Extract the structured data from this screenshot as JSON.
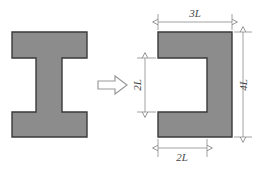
{
  "figure": {
    "background_color": "#ffffff",
    "shape_fill_color": "#8c8c8c",
    "shape_stroke_color": "#3a3a3a",
    "dimension_line_color": "#8a8a8a",
    "label_color": "#4a4a4a"
  },
  "left_shape": {
    "name": "I-beam cross-section",
    "type": "I-section",
    "description": "Symmetric I-shaped (H-shaped) cross-section with two flanges and a central web"
  },
  "transform_arrow": {
    "name": "transformation arrow",
    "direction": "right",
    "style": "outlined block arrow"
  },
  "right_shape": {
    "name": "C-channel cross-section",
    "type": "C-section",
    "description": "C-shaped channel formed by removing a rectangular notch from the left side of a rectangle"
  },
  "dimensions": {
    "top": {
      "label": "3L",
      "orientation": "horizontal",
      "measures": "overall width of C-section"
    },
    "left": {
      "label": "2L",
      "orientation": "vertical",
      "measures": "height of the notch opening"
    },
    "right": {
      "label": "4L",
      "orientation": "vertical",
      "measures": "overall height of C-section"
    },
    "bottom": {
      "label": "2L",
      "orientation": "horizontal",
      "measures": "depth of the notch opening"
    }
  }
}
